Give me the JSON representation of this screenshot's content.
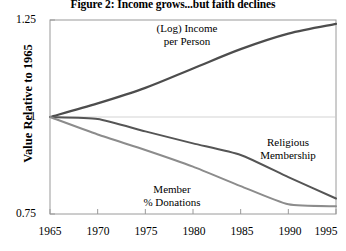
{
  "chart_data": {
    "type": "line",
    "title": "Figure 2: Income grows...but faith declines",
    "xlabel": "",
    "ylabel": "Value Relative to 1965",
    "x": [
      1965,
      1970,
      1975,
      1980,
      1985,
      1990,
      1995
    ],
    "xlim": [
      1965,
      1995
    ],
    "ylim": [
      0.75,
      1.25
    ],
    "xticks": [
      "1965",
      "1970",
      "1975",
      "1980",
      "1985",
      "1990",
      "1995"
    ],
    "yticks": [
      "1.25",
      "1",
      "0.75"
    ],
    "ytick_values": [
      1.25,
      1.0,
      0.75
    ],
    "grid": false,
    "legend": "none",
    "series": [
      {
        "name": "(Log) Income per Person",
        "color": "#4d4d4d",
        "values": [
          1.0,
          1.035,
          1.075,
          1.125,
          1.175,
          1.215,
          1.24
        ]
      },
      {
        "name": "Religious Membership",
        "color": "#555555",
        "values": [
          1.0,
          0.995,
          0.963,
          0.932,
          0.902,
          0.845,
          0.79
        ]
      },
      {
        "name": "Member % Donations",
        "color": "#8c8c8c",
        "values": [
          1.0,
          0.955,
          0.915,
          0.872,
          0.822,
          0.775,
          0.77
        ]
      }
    ],
    "annotations": [
      {
        "name": "income-annotation",
        "line1": "(Log) Income",
        "line2": "per Person"
      },
      {
        "name": "religious-membership-annotation",
        "line1": "Religious",
        "line2": "Membership"
      },
      {
        "name": "member-donations-annotation",
        "line1": "Member",
        "line2": "% Donations"
      }
    ]
  }
}
